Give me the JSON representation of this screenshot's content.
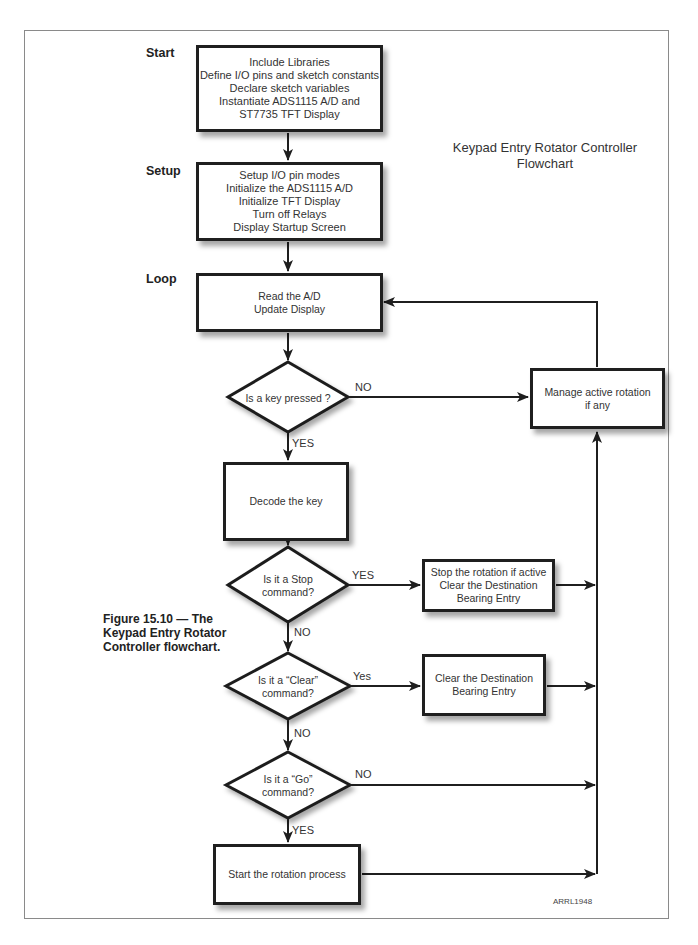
{
  "title": {
    "line1": "Keypad Entry Rotator Controller",
    "line2": "Flowchart"
  },
  "caption": {
    "line1": "Figure 15.10 — The",
    "line2": "Keypad Entry Rotator",
    "line3": "Controller flowchart."
  },
  "figure_code": "ARRL1948",
  "sections": {
    "start": "Start",
    "setup": "Setup",
    "loop": "Loop"
  },
  "nodes": {
    "init": {
      "type": "process",
      "lines": [
        "Include Libraries",
        "Define I/O pins and sketch constants",
        "Declare sketch variables",
        "Instantiate ADS1115 A/D and",
        "ST7735 TFT Display"
      ]
    },
    "setup": {
      "type": "process",
      "lines": [
        "Setup I/O pin modes",
        "Initialize the ADS1115 A/D",
        "Initialize TFT Display",
        "Turn off Relays",
        "Display Startup Screen"
      ]
    },
    "read": {
      "type": "process",
      "lines": [
        "Read the A/D",
        "Update Display"
      ]
    },
    "key_pressed": {
      "type": "decision",
      "lines": [
        "Is a key pressed ?"
      ]
    },
    "manage": {
      "type": "process",
      "lines": [
        "Manage active rotation",
        "if any"
      ]
    },
    "decode": {
      "type": "process",
      "lines": [
        "Decode the key"
      ]
    },
    "is_stop": {
      "type": "decision",
      "lines": [
        "Is  it a Stop",
        "command?"
      ]
    },
    "stop_action": {
      "type": "process",
      "lines": [
        "Stop the rotation if active",
        "Clear the Destination",
        "Bearing Entry"
      ]
    },
    "is_clear": {
      "type": "decision",
      "lines": [
        "Is it a “Clear”",
        "command?"
      ]
    },
    "clear_action": {
      "type": "process",
      "lines": [
        "Clear the Destination",
        "Bearing Entry"
      ]
    },
    "is_go": {
      "type": "decision",
      "lines": [
        "Is it a “Go”",
        "command?"
      ]
    },
    "start_rotation": {
      "type": "process",
      "lines": [
        "Start the rotation process"
      ]
    }
  },
  "edge_labels": {
    "key_no": "NO",
    "key_yes": "YES",
    "stop_yes": "YES",
    "stop_no": "NO",
    "clear_yes": "Yes",
    "clear_no": "NO",
    "go_no": "NO",
    "go_yes": "YES"
  },
  "edges": [
    {
      "from": "init",
      "to": "setup"
    },
    {
      "from": "setup",
      "to": "read"
    },
    {
      "from": "read",
      "to": "key_pressed"
    },
    {
      "from": "key_pressed",
      "to": "manage",
      "label": "NO"
    },
    {
      "from": "key_pressed",
      "to": "decode",
      "label": "YES"
    },
    {
      "from": "manage",
      "to": "read"
    },
    {
      "from": "decode",
      "to": "is_stop"
    },
    {
      "from": "is_stop",
      "to": "stop_action",
      "label": "YES"
    },
    {
      "from": "is_stop",
      "to": "is_clear",
      "label": "NO"
    },
    {
      "from": "stop_action",
      "to": "manage"
    },
    {
      "from": "is_clear",
      "to": "clear_action",
      "label": "Yes"
    },
    {
      "from": "is_clear",
      "to": "is_go",
      "label": "NO"
    },
    {
      "from": "clear_action",
      "to": "manage"
    },
    {
      "from": "is_go",
      "to": "manage",
      "label": "NO"
    },
    {
      "from": "is_go",
      "to": "start_rotation",
      "label": "YES"
    },
    {
      "from": "start_rotation",
      "to": "manage"
    }
  ],
  "colors": {
    "stroke": "#1f1f1f",
    "frame": "#8a8a8a",
    "text": "#333333",
    "background": "#ffffff"
  }
}
